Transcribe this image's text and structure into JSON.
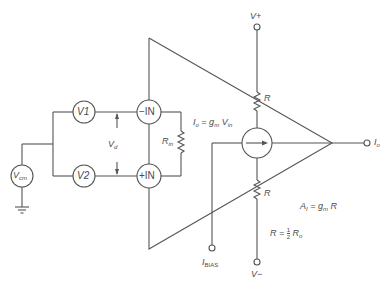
{
  "diagram": {
    "type": "circuit-schematic",
    "sources": {
      "v1": "V1",
      "v2": "V2",
      "vcm": {
        "main": "V",
        "sub": "cm"
      }
    },
    "inputs": {
      "inverting": "−IN",
      "noninverting": "+IN"
    },
    "differential_voltage": {
      "main": "V",
      "sub": "d"
    },
    "input_resistance": {
      "main": "R",
      "sub": "in"
    },
    "output_current_equation": {
      "lhs_main": "I",
      "lhs_sub": "o",
      "eq": " = g",
      "gm_sub": "m",
      "v": " V",
      "v_sub": "in"
    },
    "supplies": {
      "positive": "V+",
      "negative": "V−"
    },
    "resistors": {
      "upper": "R",
      "lower": "R"
    },
    "bias": {
      "main": "I",
      "sub": "BIAS"
    },
    "output": {
      "main": "I",
      "sub": "o"
    },
    "gain_equation": {
      "lhs_main": "A",
      "lhs_sub": "I",
      "eq": " = g",
      "gm_sub": "m",
      "rhs": " R"
    },
    "resistance_equation": {
      "lhs": "R = ",
      "frac_num": "1",
      "frac_den": "2",
      "rhs_main": " R",
      "rhs_sub": "o"
    },
    "colors": {
      "line": "#555555",
      "text": "#4a4a4a",
      "background": "#ffffff"
    }
  }
}
